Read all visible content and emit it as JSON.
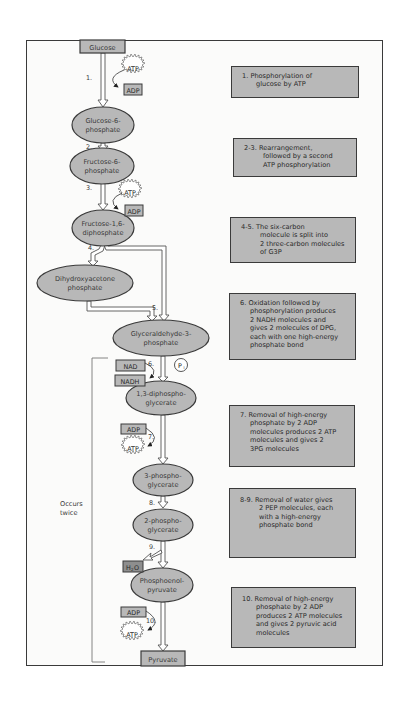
{
  "diagram": {
    "colors": {
      "node_fill": "#b8b8b8",
      "border": "#3a3a3a",
      "background": "#fbfbfa",
      "arrow_fill": "#ffffff"
    },
    "start": "Glucose",
    "end": "Pyruvate",
    "nodes": {
      "glucose_6_phosphate": [
        "Glucose-6-",
        "phosphate"
      ],
      "fructose_6_phosphate": [
        "Fructose-6-",
        "phosphate"
      ],
      "fructose_1_6_diphosphate": [
        "Fructose-1,6-",
        "diphosphate"
      ],
      "dihydroxyacetone_phosphate": [
        "Dihydroxyacetone",
        "phosphate"
      ],
      "glyceraldehyde_3_phosphate": [
        "Glyceraldehyde-3-",
        "phosphate"
      ],
      "diphosphoglycerate_1_3": [
        "1,3-diphospho-",
        "glycerate"
      ],
      "phosphoglycerate_3": [
        "3-phospho-",
        "glycerate"
      ],
      "phosphoglycerate_2": [
        "2-phospho-",
        "glycerate"
      ],
      "phosphoenolpyruvate": [
        "Phosphoenol-",
        "pyruvate"
      ]
    },
    "step_labels": {
      "s1": "1.",
      "s2": "2.",
      "s3": "3.",
      "s4": "4.",
      "s5": "5.",
      "s6": "6.",
      "s7": "7.",
      "s8": "8.",
      "s9": "9.",
      "s10": "10."
    },
    "cofactors": {
      "atp": "ATP",
      "adp": "ADP",
      "nad": "NAD",
      "nadh": "NADH",
      "pi": "P",
      "pi_sub": "i",
      "water": "H",
      "water_sub": "2",
      "water_o": "O"
    },
    "bracket_label": [
      "Occurs",
      "twice"
    ],
    "descriptions": [
      {
        "num": "1.",
        "lines": [
          "Phosphorylation of",
          "glucose by ATP"
        ]
      },
      {
        "num": "2-3.",
        "lines": [
          "Rearrangement,",
          "followed by a second",
          "ATP phosphorylation"
        ]
      },
      {
        "num": "4-5.",
        "lines": [
          "The six-carbon",
          "molecule is split into",
          "2 three-carbon molecules",
          "of G3P"
        ]
      },
      {
        "num": "6.",
        "lines": [
          "Oxidation followed by",
          "phosphorylation produces",
          "2 NADH molecules and",
          "gives 2 molecules of DPG,",
          "each with one high-energy",
          "phosphate bond"
        ]
      },
      {
        "num": "7.",
        "lines": [
          "Removal of high-energy",
          "phosphate by 2 ADP",
          "molecules produces 2 ATP",
          "molecules and gives 2",
          "3PG molecules"
        ]
      },
      {
        "num": "8-9.",
        "lines": [
          "Removal of water gives",
          "2 PEP molecules, each",
          "with a high-energy",
          "phosphate bond"
        ]
      },
      {
        "num": "10.",
        "lines": [
          "Removal of high-energy",
          "phosphate by 2 ADP",
          "produces 2 ATP molecules",
          "and gives 2 pyruvic acid",
          "molecules"
        ]
      }
    ]
  }
}
